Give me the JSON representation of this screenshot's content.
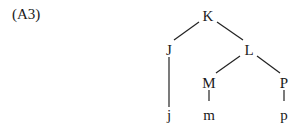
{
  "example_label": "(A3)",
  "tree": {
    "nodes": [
      {
        "id": "K",
        "label": "K"
      },
      {
        "id": "J",
        "label": "J"
      },
      {
        "id": "L",
        "label": "L"
      },
      {
        "id": "M",
        "label": "M"
      },
      {
        "id": "P",
        "label": "P"
      },
      {
        "id": "j",
        "label": "j"
      },
      {
        "id": "m",
        "label": "m"
      },
      {
        "id": "p",
        "label": "p"
      }
    ],
    "edges": [
      [
        "K",
        "J"
      ],
      [
        "K",
        "L"
      ],
      [
        "J",
        "j"
      ],
      [
        "L",
        "M"
      ],
      [
        "L",
        "P"
      ],
      [
        "M",
        "m"
      ],
      [
        "P",
        "p"
      ]
    ]
  }
}
